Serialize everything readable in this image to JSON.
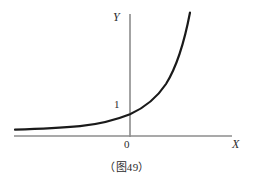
{
  "figure": {
    "caption": "（图49）",
    "background_color": "#ffffff",
    "axis_color": "#8c8c8c",
    "curve_color": "#1a1a1a"
  },
  "labels": {
    "y_axis": "Y",
    "x_axis": "X",
    "origin": "0",
    "y_intercept": "1"
  },
  "chart_data": {
    "type": "line",
    "title": "（图49）",
    "xlabel": "X",
    "ylabel": "Y",
    "legend": [],
    "grid": false,
    "annotations": [
      "1",
      "0"
    ],
    "axis": {
      "x_axis_pixel_y": 136,
      "x_axis_pixel_x_start": 14,
      "x_axis_pixel_x_end": 232,
      "y_axis_pixel_x": 130,
      "y_axis_pixel_y_top": 14,
      "y_axis_pixel_y_bottom": 137
    },
    "function": "y = a^x, a > 1",
    "x": [
      -4.0,
      -3.5,
      -3.0,
      -2.5,
      -2.0,
      -1.5,
      -1.0,
      -0.5,
      0.0,
      0.5,
      1.0,
      1.5,
      2.0,
      2.5,
      3.0
    ],
    "values": [
      0.06,
      0.09,
      0.13,
      0.18,
      0.25,
      0.35,
      0.5,
      0.71,
      1.0,
      1.41,
      2.0,
      2.83,
      4.0,
      5.66,
      8.0
    ],
    "xlim": [
      -4.0,
      3.0
    ],
    "ylim": [
      0,
      8.5
    ],
    "curve_path": "M 15,129.6 C 40,129.0 62,128.0 80,126.2 C 98,124.2 114,120.6 130,114.2 C 144,108.0 156,99.0 166,84.0 C 176,68.0 184,44.0 190,12.5",
    "curve_stroke_width": 2.2
  }
}
